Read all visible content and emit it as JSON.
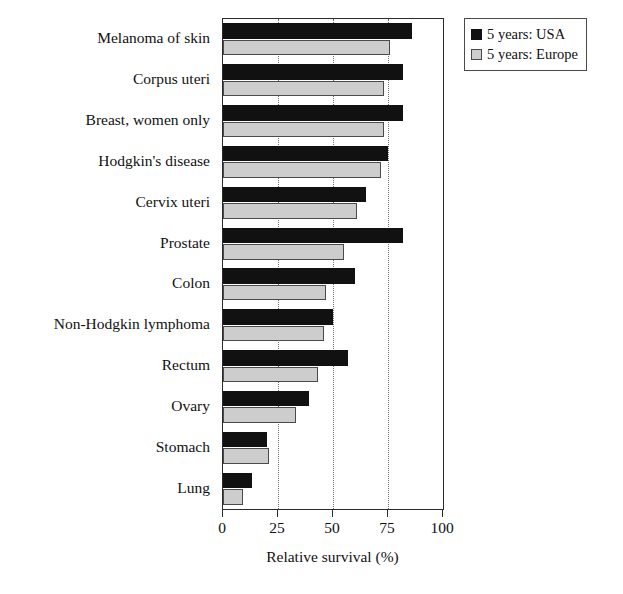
{
  "chart_data": {
    "type": "bar",
    "orientation": "horizontal",
    "title": "",
    "xlabel": "Relative survival (%)",
    "ylabel": "",
    "xlim": [
      0,
      100
    ],
    "xticks": [
      0,
      25,
      50,
      75,
      100
    ],
    "xtick_labels": [
      "0",
      "25",
      "50",
      "75",
      "100"
    ],
    "grid": "vertical dotted gridlines at 25, 50, 75",
    "legend_position": "top-right outside",
    "categories": [
      "Melanoma of skin",
      "Corpus uteri",
      "Breast, women only",
      "Hodgkin's disease",
      "Cervix uteri",
      "Prostate",
      "Colon",
      "Non-Hodgkin lymphoma",
      "Rectum",
      "Ovary",
      "Stomach",
      "Lung"
    ],
    "series": [
      {
        "name": "5 years: USA",
        "color": "#111111",
        "values": [
          86,
          82,
          82,
          75,
          65,
          82,
          60,
          50,
          57,
          39,
          20,
          13
        ]
      },
      {
        "name": "5 years: Europe",
        "color": "#cdcdcd",
        "values": [
          76,
          73,
          73,
          72,
          61,
          55,
          47,
          46,
          43,
          33,
          21,
          9
        ]
      }
    ]
  },
  "legend": {
    "items": [
      {
        "label": "5 years: USA",
        "swatch": "black-square-swatch"
      },
      {
        "label": "5 years: Europe",
        "swatch": "gray-square-swatch"
      }
    ]
  },
  "axis": {
    "x_title": "Relative survival (%)",
    "ticks": [
      "0",
      "25",
      "50",
      "75",
      "100"
    ]
  }
}
